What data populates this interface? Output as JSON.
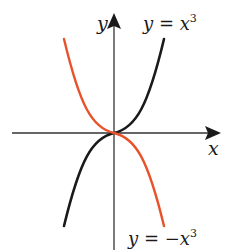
{
  "figure": {
    "type": "function-graph",
    "axes": {
      "x_label": "x",
      "y_label": "y"
    },
    "curves": [
      {
        "name": "cubic",
        "label": "y = x",
        "exponent": "3",
        "color": "#1a1a1a",
        "equation": "y = x^3"
      },
      {
        "name": "negative-cubic",
        "label": "y = −x",
        "exponent": "3",
        "color": "#e8512a",
        "equation": "y = -x^3"
      }
    ],
    "axis_color": "#1a1a1a"
  }
}
